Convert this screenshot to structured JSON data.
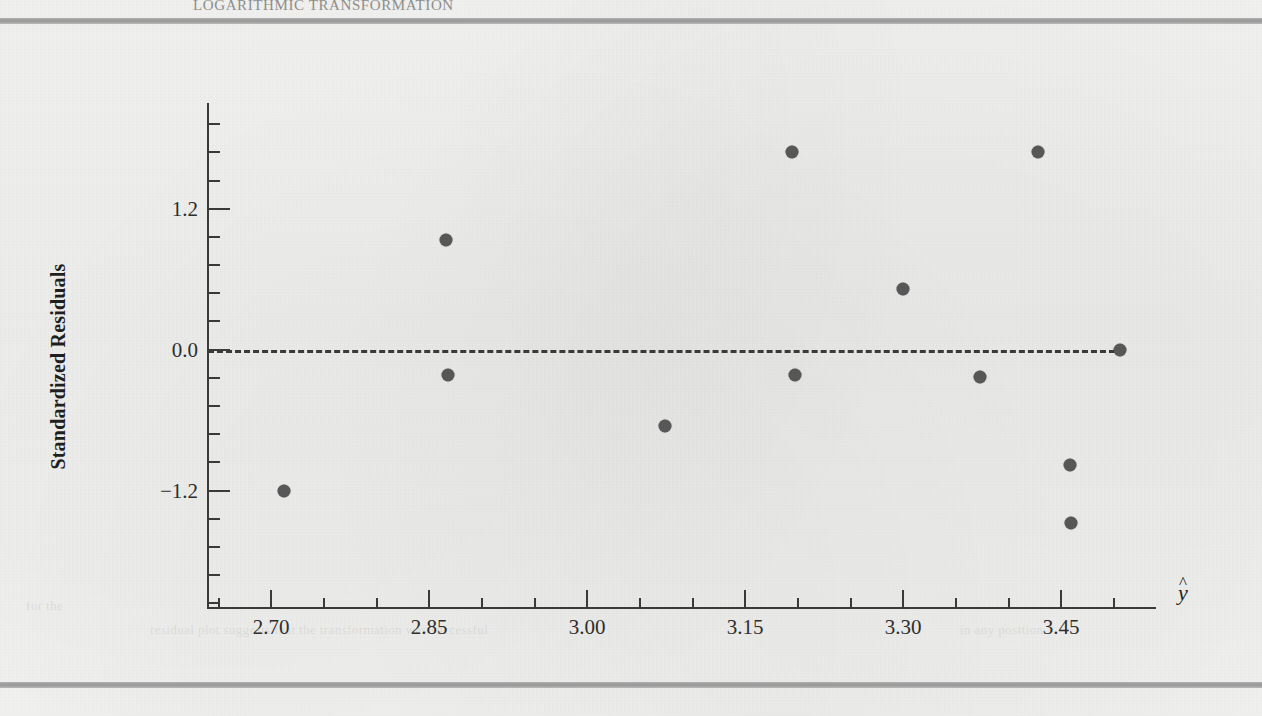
{
  "page": {
    "running_head": "LOGARITHMIC TRANSFORMATION",
    "bleed_text_left": "for the",
    "bleed_text_mid": "residual plot suggests that the transformation was successful",
    "bleed_text_right": "in any position"
  },
  "chart_data": {
    "type": "scatter",
    "title": "",
    "xlabel": "ŷ",
    "ylabel": "Standardized Residuals",
    "xticks": [
      "2.70",
      "2.85",
      "3.00",
      "3.15",
      "3.30",
      "3.45"
    ],
    "xtick_values": [
      2.7,
      2.85,
      3.0,
      3.15,
      3.3,
      3.45
    ],
    "yticks": [
      "1.2",
      "0.0",
      "-1.2"
    ],
    "ytick_values": [
      1.2,
      0.0,
      -1.2
    ],
    "xlim": [
      2.64,
      3.54
    ],
    "ylim": [
      -2.2,
      2.1
    ],
    "grid": false,
    "legend": false,
    "reference_line": {
      "y": 0.0,
      "style": "dashed",
      "x_start": 2.64,
      "x_end": 3.51
    },
    "marker_color": "#575757",
    "axis_color": "#3a3a3a",
    "points": [
      {
        "x": 2.712,
        "y": -1.2
      },
      {
        "x": 2.866,
        "y": 0.93
      },
      {
        "x": 2.868,
        "y": -0.22
      },
      {
        "x": 3.074,
        "y": -0.65
      },
      {
        "x": 3.194,
        "y": 1.68
      },
      {
        "x": 3.197,
        "y": -0.22
      },
      {
        "x": 3.3,
        "y": 0.52
      },
      {
        "x": 3.373,
        "y": -0.23
      },
      {
        "x": 3.428,
        "y": 1.68
      },
      {
        "x": 3.458,
        "y": -0.98
      },
      {
        "x": 3.459,
        "y": -1.48
      },
      {
        "x": 3.506,
        "y": 0.0
      }
    ]
  }
}
